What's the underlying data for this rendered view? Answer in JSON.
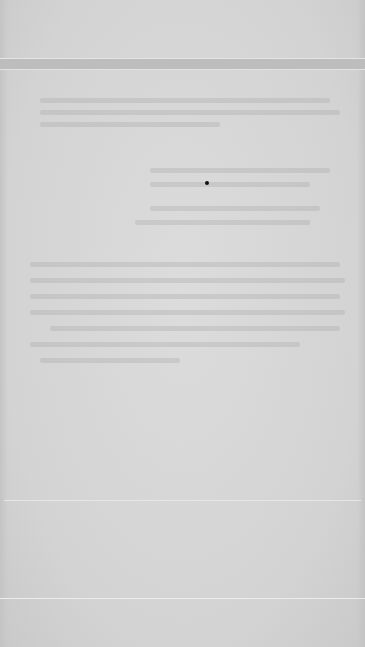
{
  "document": {
    "type": "scanned-page",
    "background_color": "#d6d6d6",
    "header_band_color": "#bdbdbd",
    "marker_dot_color": "#111111",
    "text_legible": false,
    "ghost_text_blocks": [
      {
        "name": "upper-paragraph",
        "lines": 3
      },
      {
        "name": "middle-paragraph",
        "lines": 4
      },
      {
        "name": "lower-paragraph",
        "lines": 7
      }
    ]
  }
}
